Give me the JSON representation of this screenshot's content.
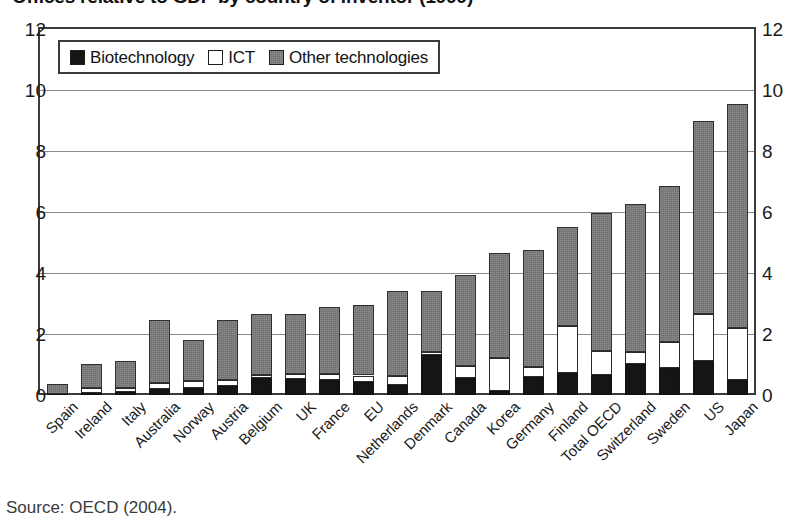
{
  "title": "Offices relative to GDP by country of inventor (1999)",
  "source_note": "Source: OECD (2004).",
  "legend": {
    "position": "top-left-inside",
    "items": [
      {
        "label": "Biotechnology",
        "swatch": "black-filled-square",
        "color": "#151515"
      },
      {
        "label": "ICT",
        "swatch": "white-open-square",
        "color": "#ffffff"
      },
      {
        "label": "Other technologies",
        "swatch": "gray-hatched-square",
        "color": "#6e6e6e"
      }
    ]
  },
  "axes": {
    "y_left_ticks": [
      "0",
      "2",
      "4",
      "6",
      "8",
      "10",
      "12"
    ],
    "y_right_ticks": [
      "0",
      "2",
      "4",
      "6",
      "8",
      "10",
      "12"
    ],
    "y_min": 0,
    "y_max": 12,
    "y_step": 2,
    "grid": "horizontal"
  },
  "chart_data": {
    "type": "bar",
    "stacked": true,
    "title": "Offices relative to GDP by country of inventor (1999)",
    "xlabel": "",
    "ylabel": "",
    "ylim": [
      0,
      12
    ],
    "ytick_step": 2,
    "grid": true,
    "legend_position": "top-left-inside",
    "categories": [
      "Spain",
      "Ireland",
      "Italy",
      "Australia",
      "Norway",
      "Austria",
      "Belgium",
      "UK",
      "France",
      "EU",
      "Netherlands",
      "Denmark",
      "Canada",
      "Korea",
      "Germany",
      "Finland",
      "Total OECD",
      "Switzerland",
      "Sweden",
      "US",
      "Japan"
    ],
    "series": [
      {
        "name": "Biotechnology",
        "color": "#151515",
        "values": [
          0.02,
          0.08,
          0.1,
          0.2,
          0.22,
          0.28,
          0.55,
          0.52,
          0.5,
          0.42,
          0.32,
          1.3,
          0.55,
          0.12,
          0.58,
          0.72,
          0.65,
          1.02,
          0.88,
          1.1,
          0.48
        ]
      },
      {
        "name": "ICT",
        "color": "#ffffff",
        "values": [
          0.0,
          0.14,
          0.12,
          0.18,
          0.24,
          0.22,
          0.12,
          0.16,
          0.18,
          0.22,
          0.3,
          0.12,
          0.4,
          1.1,
          0.35,
          1.55,
          0.78,
          0.4,
          0.85,
          1.55,
          1.72
        ]
      },
      {
        "name": "Other technologies",
        "color": "#6e6e6e",
        "values": [
          0.33,
          0.8,
          0.9,
          2.07,
          1.34,
          1.95,
          2.0,
          1.98,
          2.22,
          2.32,
          2.78,
          2.0,
          3.0,
          3.45,
          3.82,
          3.23,
          4.55,
          4.83,
          5.12,
          6.35,
          7.35
        ]
      }
    ],
    "totals": [
      0.35,
      1.02,
      1.12,
      2.45,
      1.8,
      2.45,
      2.67,
      2.66,
      2.9,
      2.96,
      3.4,
      3.42,
      3.95,
      4.67,
      4.75,
      5.5,
      5.98,
      6.25,
      6.85,
      9.0,
      9.55
    ]
  }
}
